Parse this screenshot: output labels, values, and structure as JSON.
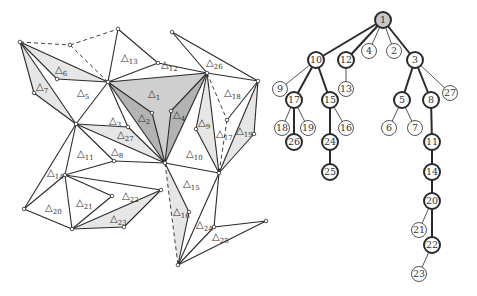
{
  "colors": {
    "edge": "#2a2a2a",
    "shade_light": "#e6e6e6",
    "shade_mid": "#cfcfcf",
    "shade_dark": "#b3b3b3",
    "root_fill": "#c8c8c8",
    "background": "#ffffff"
  },
  "mesh": {
    "vertices": {
      "A": [
        20,
        42
      ],
      "B": [
        118,
        29
      ],
      "C": [
        70,
        45
      ],
      "D": [
        108,
        82
      ],
      "E": [
        158,
        63
      ],
      "F": [
        172,
        32
      ],
      "G": [
        207,
        73
      ],
      "H": [
        258,
        81
      ],
      "I": [
        34,
        93
      ],
      "J": [
        57,
        79
      ],
      "K": [
        76,
        124
      ],
      "L": [
        128,
        127
      ],
      "M": [
        152,
        113
      ],
      "N": [
        171,
        111
      ],
      "O": [
        165,
        163
      ],
      "P": [
        114,
        161
      ],
      "Q": [
        65,
        175
      ],
      "R": [
        24,
        209
      ],
      "S": [
        72,
        229
      ],
      "T": [
        112,
        196
      ],
      "U": [
        161,
        190
      ],
      "V": [
        124,
        227
      ],
      "W": [
        219,
        173
      ],
      "X": [
        196,
        129
      ],
      "Y": [
        227,
        120
      ],
      "Z": [
        254,
        134
      ],
      "AA": [
        189,
        212
      ],
      "BB": [
        178,
        265
      ],
      "CC": [
        214,
        227
      ],
      "DD": [
        266,
        221
      ]
    },
    "triangles": [
      {
        "id": "1",
        "label": "△",
        "sub": "1",
        "verts": [
          "D",
          "G",
          "O"
        ],
        "shade": "mid",
        "lx": 148,
        "ly": 97
      },
      {
        "id": "2",
        "label": "△",
        "sub": "2",
        "verts": [
          "D",
          "M",
          "O"
        ],
        "shade": "dark",
        "lx": 138,
        "ly": 121
      },
      {
        "id": "3",
        "label": "△",
        "sub": "3",
        "verts": [
          "K",
          "L",
          "D"
        ],
        "shade": "none",
        "lx": 109,
        "ly": 124
      },
      {
        "id": "4",
        "label": "△",
        "sub": "4",
        "verts": [
          "N",
          "G",
          "O"
        ],
        "shade": "dark",
        "lx": 173,
        "ly": 118
      },
      {
        "id": "5",
        "label": "△",
        "sub": "5",
        "verts": [
          "A",
          "D",
          "K"
        ],
        "shade": "none",
        "lx": 77,
        "ly": 96
      },
      {
        "id": "6",
        "label": "△",
        "sub": "6",
        "verts": [
          "A",
          "J",
          "D"
        ],
        "shade": "light",
        "lx": 55,
        "ly": 73
      },
      {
        "id": "7",
        "label": "△",
        "sub": "7",
        "verts": [
          "A",
          "I",
          "K"
        ],
        "shade": "light",
        "lx": 36,
        "ly": 90
      },
      {
        "id": "8",
        "label": "△",
        "sub": "8",
        "verts": [
          "K",
          "P",
          "O"
        ],
        "shade": "none",
        "lx": 111,
        "ly": 155
      },
      {
        "id": "9",
        "label": "△",
        "sub": "9",
        "verts": [
          "G",
          "X",
          "W"
        ],
        "shade": "light",
        "lx": 198,
        "ly": 126
      },
      {
        "id": "10",
        "label": "△",
        "sub": "10",
        "verts": [
          "G",
          "O",
          "W"
        ],
        "shade": "none",
        "lx": 186,
        "ly": 157
      },
      {
        "id": "11",
        "label": "△",
        "sub": "11",
        "verts": [
          "K",
          "Q",
          "P"
        ],
        "shade": "none",
        "lx": 77,
        "ly": 157
      },
      {
        "id": "12",
        "label": "△",
        "sub": "12",
        "verts": [
          "D",
          "E",
          "G"
        ],
        "shade": "none",
        "lx": 161,
        "ly": 68
      },
      {
        "id": "13",
        "label": "△",
        "sub": "13",
        "verts": [
          "B",
          "E",
          "D"
        ],
        "shade": "none",
        "lx": 121,
        "ly": 61
      },
      {
        "id": "14",
        "label": "△",
        "sub": "14",
        "verts": [
          "K",
          "R",
          "Q"
        ],
        "shade": "none",
        "lx": 47,
        "ly": 176
      },
      {
        "id": "15",
        "label": "△",
        "sub": "15",
        "verts": [
          "O",
          "W",
          "BB"
        ],
        "shade": "none",
        "lx": 183,
        "ly": 187
      },
      {
        "id": "16",
        "label": "△",
        "sub": "16",
        "verts": [
          "O",
          "AA",
          "BB"
        ],
        "shade": "light",
        "lx": 173,
        "ly": 215
      },
      {
        "id": "17",
        "label": "△",
        "sub": "17",
        "verts": [
          "Y",
          "W",
          "H"
        ],
        "shade": "none",
        "lx": 216,
        "ly": 137
      },
      {
        "id": "18",
        "label": "△",
        "sub": "18",
        "verts": [
          "G",
          "Y",
          "H"
        ],
        "shade": "none",
        "lx": 224,
        "ly": 96
      },
      {
        "id": "19",
        "label": "△",
        "sub": "19",
        "verts": [
          "H",
          "Z",
          "W"
        ],
        "shade": "light",
        "lx": 236,
        "ly": 134
      },
      {
        "id": "20",
        "label": "△",
        "sub": "20",
        "verts": [
          "Q",
          "R",
          "S"
        ],
        "shade": "none",
        "lx": 45,
        "ly": 211
      },
      {
        "id": "21",
        "label": "△",
        "sub": "21",
        "verts": [
          "Q",
          "T",
          "S"
        ],
        "shade": "none",
        "lx": 76,
        "ly": 206
      },
      {
        "id": "22",
        "label": "△",
        "sub": "22",
        "verts": [
          "Q",
          "U",
          "S"
        ],
        "shade": "none",
        "lx": 122,
        "ly": 199
      },
      {
        "id": "23",
        "label": "△",
        "sub": "23",
        "verts": [
          "S",
          "U",
          "V"
        ],
        "shade": "light",
        "lx": 110,
        "ly": 222
      },
      {
        "id": "24",
        "label": "△",
        "sub": "24",
        "verts": [
          "W",
          "CC",
          "BB"
        ],
        "shade": "none",
        "lx": 196,
        "ly": 228
      },
      {
        "id": "25",
        "label": "△",
        "sub": "25",
        "verts": [
          "CC",
          "DD",
          "BB"
        ],
        "shade": "none",
        "lx": 212,
        "ly": 240
      },
      {
        "id": "26",
        "label": "△",
        "sub": "26",
        "verts": [
          "F",
          "G",
          "H"
        ],
        "shade": "none",
        "lx": 206,
        "ly": 66
      },
      {
        "id": "27",
        "label": "△",
        "sub": "27",
        "verts": [
          "K",
          "L",
          "O"
        ],
        "shade": "light",
        "lx": 117,
        "ly": 138
      }
    ],
    "dashed_edges": [
      [
        "A",
        "C"
      ],
      [
        "C",
        "B"
      ],
      [
        "C",
        "D"
      ],
      [
        "G",
        "Y"
      ],
      [
        "Y",
        "W"
      ],
      [
        "O",
        "BB"
      ]
    ]
  },
  "tree": {
    "nodes": [
      {
        "id": "1",
        "x": 383,
        "y": 20,
        "style": "root"
      },
      {
        "id": "10",
        "x": 316,
        "y": 60,
        "style": "bold"
      },
      {
        "id": "12",
        "x": 346,
        "y": 60,
        "style": "bold"
      },
      {
        "id": "4",
        "x": 369,
        "y": 51,
        "style": "thin"
      },
      {
        "id": "2",
        "x": 394,
        "y": 51,
        "style": "thin"
      },
      {
        "id": "3",
        "x": 415,
        "y": 60,
        "style": "bold"
      },
      {
        "id": "9",
        "x": 280,
        "y": 89,
        "style": "thin"
      },
      {
        "id": "17",
        "x": 294,
        "y": 100,
        "style": "bold"
      },
      {
        "id": "15",
        "x": 330,
        "y": 100,
        "style": "bold"
      },
      {
        "id": "13",
        "x": 346,
        "y": 89,
        "style": "thin"
      },
      {
        "id": "5",
        "x": 402,
        "y": 100,
        "style": "bold"
      },
      {
        "id": "8",
        "x": 431,
        "y": 100,
        "style": "bold"
      },
      {
        "id": "27",
        "x": 450,
        "y": 93,
        "style": "thin"
      },
      {
        "id": "18",
        "x": 282,
        "y": 128,
        "style": "thin"
      },
      {
        "id": "19",
        "x": 308,
        "y": 128,
        "style": "thin"
      },
      {
        "id": "16",
        "x": 346,
        "y": 128,
        "style": "thin"
      },
      {
        "id": "6",
        "x": 389,
        "y": 128,
        "style": "thin"
      },
      {
        "id": "7",
        "x": 415,
        "y": 128,
        "style": "thin"
      },
      {
        "id": "26",
        "x": 294,
        "y": 142,
        "style": "bold"
      },
      {
        "id": "24",
        "x": 330,
        "y": 142,
        "style": "bold"
      },
      {
        "id": "11",
        "x": 432,
        "y": 142,
        "style": "bold"
      },
      {
        "id": "25",
        "x": 330,
        "y": 172,
        "style": "bold"
      },
      {
        "id": "14",
        "x": 432,
        "y": 172,
        "style": "bold"
      },
      {
        "id": "20",
        "x": 432,
        "y": 201,
        "style": "bold"
      },
      {
        "id": "21",
        "x": 419,
        "y": 230,
        "style": "thin"
      },
      {
        "id": "22",
        "x": 432,
        "y": 245,
        "style": "bold"
      },
      {
        "id": "23",
        "x": 419,
        "y": 274,
        "style": "thin"
      }
    ],
    "edges": [
      {
        "from": "1",
        "to": "10",
        "bold": true
      },
      {
        "from": "1",
        "to": "12",
        "bold": true
      },
      {
        "from": "1",
        "to": "4",
        "bold": false
      },
      {
        "from": "1",
        "to": "2",
        "bold": false
      },
      {
        "from": "1",
        "to": "3",
        "bold": true
      },
      {
        "from": "10",
        "to": "9",
        "bold": false
      },
      {
        "from": "10",
        "to": "17",
        "bold": true
      },
      {
        "from": "10",
        "to": "15",
        "bold": true
      },
      {
        "from": "12",
        "to": "13",
        "bold": false
      },
      {
        "from": "3",
        "to": "5",
        "bold": true
      },
      {
        "from": "3",
        "to": "8",
        "bold": true
      },
      {
        "from": "3",
        "to": "27",
        "bold": false
      },
      {
        "from": "17",
        "to": "18",
        "bold": false
      },
      {
        "from": "17",
        "to": "26",
        "bold": true
      },
      {
        "from": "17",
        "to": "19",
        "bold": false
      },
      {
        "from": "15",
        "to": "24",
        "bold": true
      },
      {
        "from": "15",
        "to": "16",
        "bold": false
      },
      {
        "from": "5",
        "to": "6",
        "bold": false
      },
      {
        "from": "5",
        "to": "7",
        "bold": false
      },
      {
        "from": "8",
        "to": "11",
        "bold": true
      },
      {
        "from": "24",
        "to": "25",
        "bold": true
      },
      {
        "from": "11",
        "to": "14",
        "bold": true
      },
      {
        "from": "14",
        "to": "20",
        "bold": true
      },
      {
        "from": "20",
        "to": "21",
        "bold": false
      },
      {
        "from": "20",
        "to": "22",
        "bold": true
      },
      {
        "from": "22",
        "to": "23",
        "bold": false
      }
    ]
  }
}
